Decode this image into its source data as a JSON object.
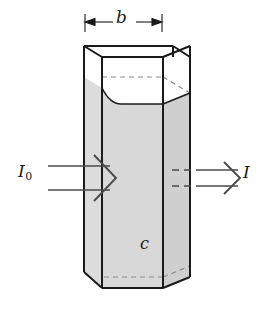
{
  "figure": {
    "kind": "beer-lambert-cuvette-diagram",
    "background_color": "#ffffff",
    "line_color": "#1a1a1a",
    "hidden_line_color": "#8c8c8c",
    "solution_fill_color": "#d8d8d8",
    "solution_fill_color_right": "#cfcfcf",
    "arrow_color": "#4a4a4a"
  },
  "labels": {
    "path_length": "b",
    "concentration": "c",
    "incident_intensity": "I",
    "incident_intensity_subscript": "0",
    "transmitted_intensity": "I"
  },
  "dimension_line": {
    "name": "b",
    "x_start": 85,
    "x_end": 162,
    "y": 22
  },
  "beams": {
    "incident": {
      "label": "I0",
      "direction": "right",
      "style": "double-line-with-chevron-head",
      "y_top": 166,
      "y_bottom": 190
    },
    "transmitted": {
      "label": "I",
      "direction": "right",
      "style": "dashed-inside-then-solid-with-chevron-head",
      "y_top": 170,
      "y_bottom": 186
    }
  },
  "geometry": {
    "front_face": {
      "left": 102,
      "right": 163,
      "top": 57,
      "bottom": 288
    },
    "depth_offset": {
      "dx": 27,
      "dy": -11
    },
    "liquid_top_y": 88,
    "liquid_meniscus": true
  }
}
